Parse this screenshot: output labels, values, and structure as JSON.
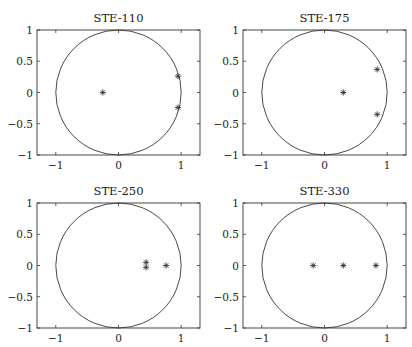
{
  "chart_data": [
    {
      "type": "scatter",
      "title": "STE-110",
      "xlabel": "",
      "ylabel": "",
      "xlim": [
        -1.3,
        1.3
      ],
      "ylim": [
        -1,
        1
      ],
      "xticks": [
        -1,
        0,
        1
      ],
      "yticks": [
        1,
        0.5,
        0,
        -0.5,
        -1
      ],
      "grid": false,
      "unit_circle": true,
      "marker": "*",
      "points": [
        {
          "x": -0.25,
          "y": 0.0
        },
        {
          "x": 0.95,
          "y": 0.26
        },
        {
          "x": 0.95,
          "y": -0.24
        }
      ]
    },
    {
      "type": "scatter",
      "title": "STE-175",
      "xlabel": "",
      "ylabel": "",
      "xlim": [
        -1.3,
        1.3
      ],
      "ylim": [
        -1,
        1
      ],
      "xticks": [
        -1,
        0,
        1
      ],
      "yticks": [
        1,
        0.5,
        0,
        -0.5,
        -1
      ],
      "grid": false,
      "unit_circle": true,
      "marker": "*",
      "points": [
        {
          "x": 0.3,
          "y": 0.0
        },
        {
          "x": 0.84,
          "y": 0.37
        },
        {
          "x": 0.84,
          "y": -0.35
        }
      ]
    },
    {
      "type": "scatter",
      "title": "STE-250",
      "xlabel": "",
      "ylabel": "",
      "xlim": [
        -1.3,
        1.3
      ],
      "ylim": [
        -1,
        1
      ],
      "xticks": [
        -1,
        0,
        1
      ],
      "yticks": [
        1,
        0.5,
        0,
        -0.5,
        -1
      ],
      "grid": false,
      "unit_circle": true,
      "marker": "*",
      "points": [
        {
          "x": 0.44,
          "y": 0.05
        },
        {
          "x": 0.44,
          "y": -0.03
        },
        {
          "x": 0.76,
          "y": 0.0
        }
      ]
    },
    {
      "type": "scatter",
      "title": "STE-330",
      "xlabel": "",
      "ylabel": "",
      "xlim": [
        -1.3,
        1.3
      ],
      "ylim": [
        -1,
        1
      ],
      "xticks": [
        -1,
        0,
        1
      ],
      "yticks": [
        1,
        0.5,
        0,
        -0.5,
        -1
      ],
      "grid": false,
      "unit_circle": true,
      "marker": "*",
      "points": [
        {
          "x": -0.18,
          "y": 0.0
        },
        {
          "x": 0.3,
          "y": 0.0
        },
        {
          "x": 0.82,
          "y": 0.0
        }
      ]
    }
  ],
  "panels": [
    {
      "title": "STE-110",
      "xtick_labels": [
        "−1",
        "0",
        "1"
      ],
      "ytick_labels": [
        "1",
        "0.5",
        "0",
        "−0.5",
        "−1"
      ]
    },
    {
      "title": "STE-175",
      "xtick_labels": [
        "−1",
        "0",
        "1"
      ],
      "ytick_labels": [
        "1",
        "0.5",
        "0",
        "−0.5",
        "−1"
      ]
    },
    {
      "title": "STE-250",
      "xtick_labels": [
        "−1",
        "0",
        "1"
      ],
      "ytick_labels": [
        "1",
        "0.5",
        "0",
        "−0.5",
        "−1"
      ]
    },
    {
      "title": "STE-330",
      "xtick_labels": [
        "−1",
        "0",
        "1"
      ],
      "ytick_labels": [
        "1",
        "0.5",
        "0",
        "−0.5",
        "−1"
      ]
    }
  ],
  "colors": {
    "axis": "#333333",
    "circle": "#333333",
    "marker": "#333333"
  }
}
